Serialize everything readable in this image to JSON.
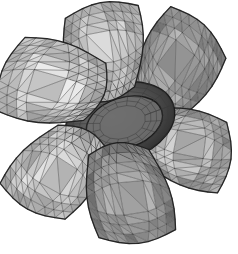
{
  "figure": {
    "title": "Triangulated minimal surface patch assembly",
    "kind": "3d-surface-mesh-rendering",
    "background_color": "#ffffff",
    "canvas": {
      "width": 238,
      "height": 254
    },
    "render_style": "grayscale flat-shaded triangles with dark wireframe edges",
    "palette": {
      "background": "#ffffff",
      "lightest_facet": "#e8e8e8",
      "light_facet": "#c8c8c8",
      "mid_facet": "#a8a8a8",
      "dark_facet": "#7a7a7a",
      "darker_facet": "#565656",
      "darkest_facet": "#2e2e2e",
      "wireframe_edge": "#3a3a3a",
      "silhouette_edge": "#1c1c1c"
    },
    "mesh": {
      "grid_u": 8,
      "grid_v": 8,
      "triangulation": "each quad split by one diagonal",
      "edge_width_px": 0.55,
      "silhouette_width_px": 1.3
    },
    "structure": {
      "description": "Six curved quadrilateral petals radiate outward from a dark central saddle throat",
      "petal_count": 6,
      "center": {
        "x": 119,
        "y": 120
      }
    },
    "parts": [
      {
        "name": "petal-top",
        "label": "Top petal",
        "angle_deg": 268,
        "shade": "mid",
        "base_fill": "#a6a6a6",
        "center": {
          "x": 104,
          "y": 52
        },
        "scale": 1.0,
        "rot_deg": -8,
        "skew_deg": -4,
        "z": 3
      },
      {
        "name": "petal-upper-right",
        "label": "Upper-right petal",
        "angle_deg": 330,
        "shade": "dark",
        "base_fill": "#8a8a8a",
        "center": {
          "x": 176,
          "y": 67
        },
        "scale": 1.02,
        "rot_deg": 40,
        "skew_deg": 6,
        "z": 2
      },
      {
        "name": "petal-right",
        "label": "Right petal",
        "angle_deg": 20,
        "shade": "mid",
        "base_fill": "#9e9e9e",
        "center": {
          "x": 185,
          "y": 147
        },
        "scale": 0.96,
        "rot_deg": 100,
        "skew_deg": -5,
        "z": 2
      },
      {
        "name": "petal-bottom",
        "label": "Bottom petal",
        "angle_deg": 85,
        "shade": "darker",
        "base_fill": "#828282",
        "center": {
          "x": 128,
          "y": 193
        },
        "scale": 1.04,
        "rot_deg": 172,
        "skew_deg": 4,
        "z": 4
      },
      {
        "name": "petal-lower-left",
        "label": "Lower-left petal",
        "angle_deg": 150,
        "shade": "light",
        "base_fill": "#b0b0b0",
        "center": {
          "x": 58,
          "y": 170
        },
        "scale": 1.0,
        "rot_deg": 212,
        "skew_deg": -6,
        "z": 3
      },
      {
        "name": "petal-left",
        "label": "Left petal",
        "angle_deg": 205,
        "shade": "light",
        "base_fill": "#b6b6b6",
        "center": {
          "x": 53,
          "y": 83
        },
        "scale": 1.06,
        "rot_deg": 288,
        "skew_deg": 5,
        "z": 3
      }
    ],
    "throat": {
      "name": "central-throat",
      "label": "Central saddle throat",
      "fill": "#3d3d3d",
      "rim_fill": "#242424",
      "inner_fill": "#6e6e6e",
      "center": {
        "x": 120,
        "y": 122
      },
      "rx": 56,
      "ry": 38,
      "rot_deg": -18
    }
  }
}
